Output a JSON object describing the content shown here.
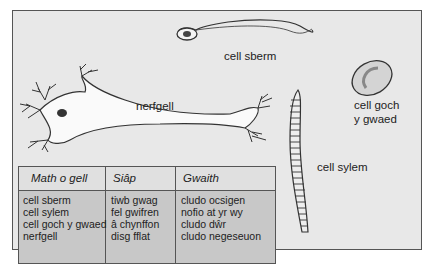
{
  "labels": {
    "sperm": "cell sberm",
    "nerve": "nerfgell",
    "red_blood_line1": "cell goch",
    "red_blood_line2": "y gwaed",
    "xylem": "cell sylem"
  },
  "table": {
    "headers": [
      "Math o gell",
      "Siâp",
      "Gwaith"
    ],
    "columns": [
      [
        "cell sberm",
        "cell sylem",
        "cell goch y gwaed",
        "nerfgell"
      ],
      [
        "tiwb gwag",
        "fel gwifren",
        "â chynffon",
        "disg fflat"
      ],
      [
        "cludo ocsigen",
        "nofio at yr wy",
        "cludo dŵr",
        "cludo negeseuon"
      ]
    ]
  },
  "colors": {
    "panel_bg": "#e8e8e8",
    "table_header_bg": "#e0e0e0",
    "table_body_bg": "#c8c8c8",
    "outline": "#333333"
  }
}
